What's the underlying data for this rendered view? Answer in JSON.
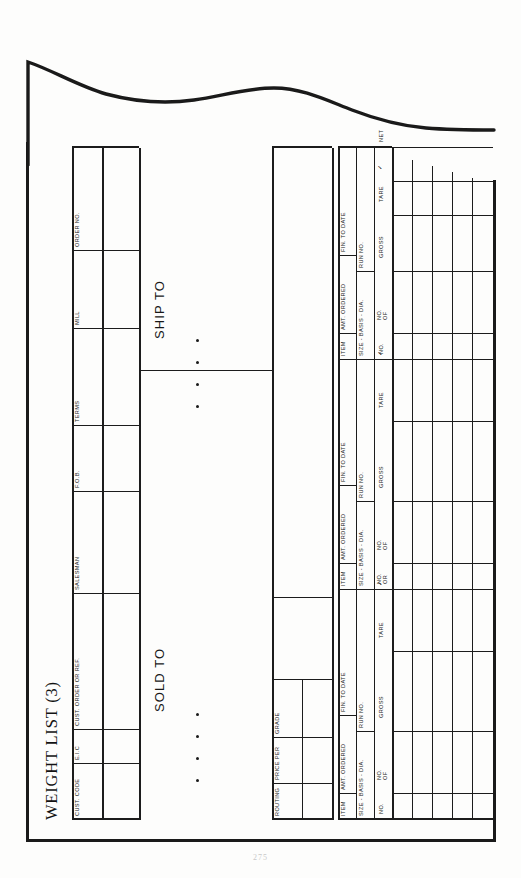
{
  "document": {
    "title": "WEIGHT LIST (3)",
    "page_number": "275",
    "orientation": "rotated-90-ccw",
    "edge_style": "torn-wavy-right-edge"
  },
  "header_fields": [
    {
      "label": "CUST. CODE"
    },
    {
      "label": "E.I.C"
    },
    {
      "label": "CUST. ORDER OR REF."
    },
    {
      "label": "SALESMAN"
    },
    {
      "label": "F.O.B."
    },
    {
      "label": "TERMS"
    },
    {
      "label": "MILL"
    },
    {
      "label": "ORDER NO."
    }
  ],
  "address_blocks": [
    {
      "label": "SOLD TO"
    },
    {
      "label": "SHIP TO"
    }
  ],
  "secondary_fields": [
    {
      "label": "ROUTING"
    },
    {
      "label": "PRICE PER"
    },
    {
      "label": "GRADE"
    }
  ],
  "line_item_headers": [
    {
      "label": "ITEM"
    },
    {
      "label": "AMT. ORDERED"
    },
    {
      "label": "FIN. TO DATE"
    },
    {
      "label": "SIZE - BASIS - DIA."
    },
    {
      "label": "RUN NO."
    }
  ],
  "weight_columns": [
    {
      "label": "NO."
    },
    {
      "label": "NO.\nOF"
    },
    {
      "label": "GROSS"
    },
    {
      "label": "TARE"
    },
    {
      "label": "✓"
    },
    {
      "label": "NET"
    }
  ],
  "weight_columns_alt": [
    {
      "label": "NO.\nOR"
    },
    {
      "label": "NO.\nOF"
    },
    {
      "label": "GROSS"
    },
    {
      "label": "TARE"
    },
    {
      "label": "✓"
    }
  ],
  "colors": {
    "ink": "#1a1a1a",
    "rule": "#1c1c1c",
    "paper": "#fdfdfc"
  }
}
